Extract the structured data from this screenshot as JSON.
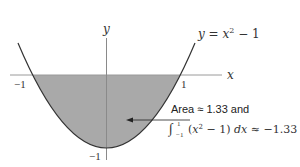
{
  "figure": {
    "function_label": "y = x² − 1",
    "axes": {
      "x_label": "x",
      "y_label": "y",
      "x_ticks": [
        {
          "value": -1,
          "label": "−1"
        },
        {
          "value": 1,
          "label": "1"
        }
      ],
      "y_ticks": [
        {
          "value": -1,
          "label": "−1"
        }
      ]
    },
    "shaded_region": {
      "from": -1,
      "to": 1,
      "color": "#a9a9a9"
    },
    "annotation": {
      "line1": "Area ≈ 1.33 and",
      "line2_integral": "∫",
      "line2_lower": "−1",
      "line2_upper": "1",
      "line2_body": "(x² − 1) dx ≈ −1.33"
    },
    "colors": {
      "curve": "#333333",
      "axis": "#9a9a9a",
      "fill": "#a9a9a9",
      "text": "#333333"
    }
  }
}
